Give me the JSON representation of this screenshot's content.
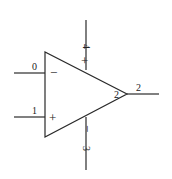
{
  "diagram": {
    "type": "operational-amplifier-schematic",
    "colors": {
      "stroke": "#2a2a2a",
      "text": "#222222",
      "background": "#ffffff"
    },
    "pins": {
      "inverting_input": {
        "number": "0",
        "symbol": "−"
      },
      "noninverting_input": {
        "number": "1",
        "symbol": "+"
      },
      "output": {
        "number": "2",
        "inner_label": "2"
      },
      "positive_supply": {
        "number": "4",
        "symbol": "+"
      },
      "negative_supply": {
        "number": "3",
        "symbol": "−"
      }
    }
  }
}
